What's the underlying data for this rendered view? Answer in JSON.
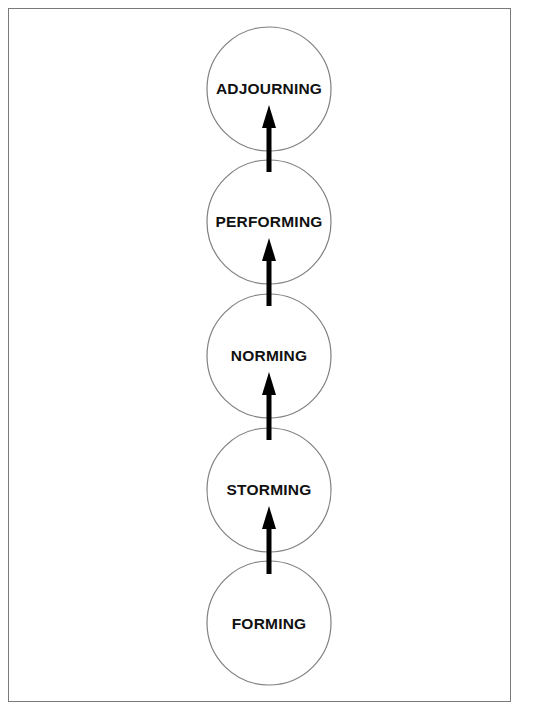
{
  "diagram": {
    "type": "vertical-stage-progression",
    "direction": "bottom-to-top",
    "colors": {
      "frame_border": "#7a7a7a",
      "circle_stroke": "#808080",
      "arrow": "#000000",
      "text": "#111111",
      "background": "#ffffff"
    },
    "stages": [
      {
        "label": "ADJOURNING",
        "order": 5
      },
      {
        "label": "PERFORMING",
        "order": 4
      },
      {
        "label": "NORMING",
        "order": 3
      },
      {
        "label": "STORMING",
        "order": 2
      },
      {
        "label": "FORMING",
        "order": 1
      }
    ],
    "arrows": [
      {
        "from": "FORMING",
        "to": "STORMING"
      },
      {
        "from": "STORMING",
        "to": "NORMING"
      },
      {
        "from": "NORMING",
        "to": "PERFORMING"
      },
      {
        "from": "PERFORMING",
        "to": "ADJOURNING"
      }
    ]
  }
}
